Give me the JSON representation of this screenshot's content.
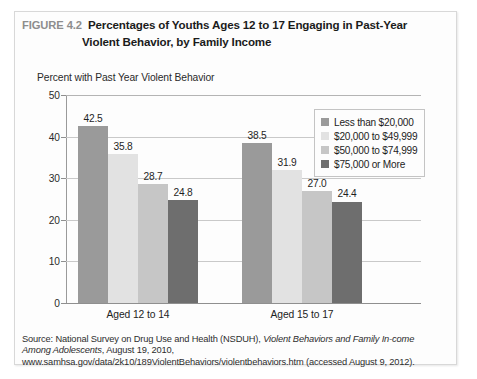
{
  "figure": {
    "number": "FIGURE 4.2",
    "title_line1": "Percentages of Youths Ages 12 to 17 Engaging in Past-Year",
    "title_line2": "Violent Behavior, by Family Income",
    "subtitle": "Percent with Past Year Violent Behavior"
  },
  "source": {
    "prefix": "Source: National Survey on Drug Use and Health (NSDUH), ",
    "italic_title": "Violent Behaviors and Family In-come Among Adolescents",
    "suffix": ", August 19, 2010, www.samhsa.gov/data/2k10/189ViolentBehaviors/violentbehaviors.htm (accessed August 9, 2012)."
  },
  "colors": {
    "series1": "#9a9a9a",
    "series2": "#e2e2e2",
    "series3": "#c6c6c6",
    "series4": "#6e6e6e",
    "gridline": "#c9c9c9",
    "axis": "#8f8f8f",
    "fig_number": "#8d8d8d"
  },
  "chart_data": {
    "type": "bar",
    "title": "Percentages of Youths Ages 12 to 17 Engaging in Past-Year Violent Behavior, by Family Income",
    "subtitle": "Percent with Past Year Violent Behavior",
    "xlabel": "",
    "ylabel": "Percent with Past Year Violent Behavior",
    "ylim": [
      0,
      50
    ],
    "yticks": [
      0,
      10,
      20,
      30,
      40,
      50
    ],
    "ytick_labels": [
      "0",
      "10",
      "20",
      "30",
      "40",
      "50"
    ],
    "grid": true,
    "grid_axis": "y",
    "legend_position": "top-right",
    "categories": [
      "Aged 12 to 14",
      "Aged 15 to 17"
    ],
    "series": [
      {
        "name": "Less than $20,000",
        "color": "#9a9a9a",
        "values": [
          42.5,
          38.5
        ]
      },
      {
        "name": "$20,000 to $49,999",
        "color": "#e2e2e2",
        "values": [
          35.8,
          31.9
        ]
      },
      {
        "name": "$50,000 to $74,999",
        "color": "#c6c6c6",
        "values": [
          28.7,
          27.0
        ]
      },
      {
        "name": "$75,000 or More",
        "color": "#6e6e6e",
        "values": [
          24.8,
          24.4
        ]
      }
    ],
    "data_labels": [
      [
        "42.5",
        "35.8",
        "28.7",
        "24.8"
      ],
      [
        "38.5",
        "31.9",
        "27.0",
        "24.4"
      ]
    ]
  }
}
